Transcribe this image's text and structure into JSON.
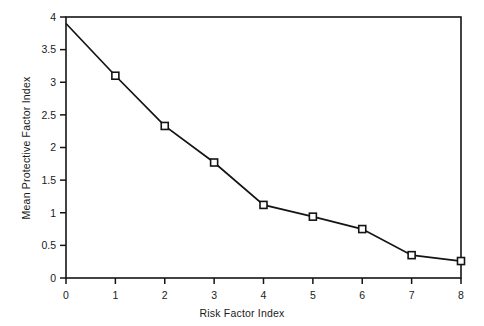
{
  "chart_data": {
    "type": "line",
    "title": "",
    "xlabel": "Risk Factor Index",
    "ylabel": "Mean Protective Factor Index",
    "x": [
      0,
      1,
      2,
      3,
      4,
      5,
      6,
      7,
      8
    ],
    "values": [
      3.9,
      3.1,
      2.33,
      1.77,
      1.12,
      0.94,
      0.75,
      0.35,
      0.26
    ],
    "series": [
      {
        "name": "Mean Protective Factor Index",
        "values": [
          3.9,
          3.1,
          2.33,
          1.77,
          1.12,
          0.94,
          0.75,
          0.35,
          0.26
        ]
      }
    ],
    "xlim": [
      0,
      8
    ],
    "ylim": [
      0,
      4
    ],
    "xticks": [
      0,
      1,
      2,
      3,
      4,
      5,
      6,
      7,
      8
    ],
    "xtick_labels": [
      "0",
      "1",
      "2",
      "3",
      "4",
      "5",
      "6",
      "7",
      "8"
    ],
    "yticks": [
      0,
      0.5,
      1,
      1.5,
      2,
      2.5,
      3,
      3.5,
      4
    ],
    "ytick_labels": [
      "0",
      "0.5",
      "1",
      "1.5",
      "2",
      "2.5",
      "3",
      "3.5",
      "4"
    ],
    "grid": false,
    "legend": false,
    "legend_position": "none",
    "marker_style": "open-square",
    "line_color": "#141414",
    "marker_face_color": "#ffffff",
    "background_color": "#ffffff"
  }
}
